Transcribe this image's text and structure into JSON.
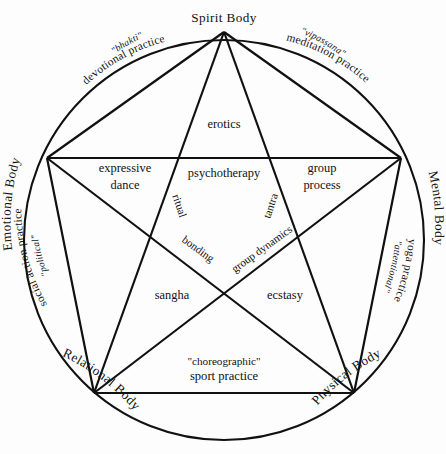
{
  "diagram": {
    "colors": {
      "stroke": "#111111",
      "background": "#fdfdfd",
      "text": "#111111"
    },
    "geometry": {
      "circle_center_x": 224,
      "circle_center_y": 240,
      "circle_radius": 200,
      "pentagon_center_x": 224,
      "pentagon_center_y": 216,
      "pentagon_radius": 186
    },
    "vertices": [
      {
        "id": "spirit",
        "label": "Spirit Body",
        "x": 224,
        "y": 32,
        "angle": -90
      },
      {
        "id": "mental",
        "label": "Mental Body",
        "x": 401,
        "y": 158,
        "angle": -18
      },
      {
        "id": "physical",
        "label": "Physical Body",
        "x": 354,
        "y": 393,
        "angle": 54
      },
      {
        "id": "relational",
        "label": "Relational Body",
        "x": 94,
        "y": 393,
        "angle": 126
      },
      {
        "id": "emotional",
        "label": "Emotional Body",
        "x": 47,
        "y": 158,
        "angle": 198
      }
    ],
    "arc_practices": [
      {
        "id": "bhakti",
        "quote": "\"bhakti\"",
        "main": "devotional practice",
        "between": [
          "emotional",
          "spirit"
        ]
      },
      {
        "id": "vipassana",
        "quote": "\"vipassana\"",
        "main": "meditation practice",
        "between": [
          "spirit",
          "mental"
        ]
      },
      {
        "id": "attentional",
        "quote": "\"attentional\"",
        "main": "yoga practice",
        "between": [
          "mental",
          "physical"
        ]
      },
      {
        "id": "choreographic",
        "quote": "\"choreographic\"",
        "main": "sport practice",
        "between": [
          "physical",
          "relational"
        ]
      },
      {
        "id": "political",
        "quote": "\"political\"",
        "main": "social action practice",
        "between": [
          "relational",
          "emotional"
        ]
      }
    ],
    "region_labels": [
      {
        "id": "erotics",
        "text": "erotics",
        "x": 224,
        "y": 124
      },
      {
        "id": "psychotherapy",
        "text": "psychotherapy",
        "x": 224,
        "y": 173
      },
      {
        "id": "expressive-dance",
        "line1": "expressive",
        "line2": "dance",
        "x": 125,
        "y": 172
      },
      {
        "id": "group-process",
        "line1": "group",
        "line2": "process",
        "x": 322,
        "y": 172
      },
      {
        "id": "sangha",
        "text": "sangha",
        "x": 172,
        "y": 295
      },
      {
        "id": "ecstasy",
        "text": "ecstasy",
        "x": 285,
        "y": 295
      }
    ],
    "edge_labels": [
      {
        "id": "ritual",
        "text": "ritual",
        "x": 176,
        "y": 207,
        "rotation": 72
      },
      {
        "id": "tantra",
        "text": "tantra",
        "x": 274,
        "y": 207,
        "rotation": -72
      },
      {
        "id": "bonding",
        "text": "bonding",
        "x": 195,
        "y": 253,
        "rotation": 36
      },
      {
        "id": "group-dynamics",
        "text": "group dynamics",
        "x": 262,
        "y": 255,
        "rotation": -36
      }
    ]
  }
}
